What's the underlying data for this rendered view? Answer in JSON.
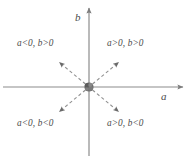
{
  "figure": {
    "background_color": "#ffffff",
    "line_color": "#8c8c8c",
    "text_color": "#4a4a4a",
    "origin_marker_color": "#6e6e6e",
    "axes": {
      "horizontal": {
        "label": "a",
        "label_style": "italic",
        "y": 87,
        "x_start": 3,
        "x_end": 185,
        "arrow_end": "right"
      },
      "vertical": {
        "label": "b",
        "label_style": "italic",
        "x": 89,
        "y_start": 156,
        "y_end": 6,
        "arrow_end": "top"
      }
    },
    "origin": {
      "x": 89,
      "y": 87,
      "marker": "filled-blob",
      "radius": 5
    },
    "quadrant_labels": [
      {
        "id": "upper-left",
        "text": "a<0, b>0",
        "quadrant": "II",
        "a_sign": "negative",
        "b_sign": "positive"
      },
      {
        "id": "upper-right",
        "text": "a>0, b>0",
        "quadrant": "I",
        "a_sign": "positive",
        "b_sign": "positive"
      },
      {
        "id": "lower-left",
        "text": "a<0, b<0",
        "quadrant": "III",
        "a_sign": "negative",
        "b_sign": "negative"
      },
      {
        "id": "lower-right",
        "text": "a>0, b<0",
        "quadrant": "IV",
        "a_sign": "positive",
        "b_sign": "negative"
      }
    ],
    "dashed_arrows": [
      {
        "id": "arrow-upper-left",
        "from": [
          89,
          87
        ],
        "to": [
          58,
          61
        ],
        "style": "dashed",
        "arrowhead": "end"
      },
      {
        "id": "arrow-upper-right",
        "from": [
          89,
          87
        ],
        "to": [
          120,
          61
        ],
        "style": "dashed",
        "arrowhead": "end"
      },
      {
        "id": "arrow-lower-left",
        "from": [
          89,
          87
        ],
        "to": [
          58,
          113
        ],
        "style": "dashed",
        "arrowhead": "end"
      },
      {
        "id": "arrow-lower-right",
        "from": [
          89,
          87
        ],
        "to": [
          120,
          113
        ],
        "style": "dashed",
        "arrowhead": "end"
      }
    ]
  }
}
